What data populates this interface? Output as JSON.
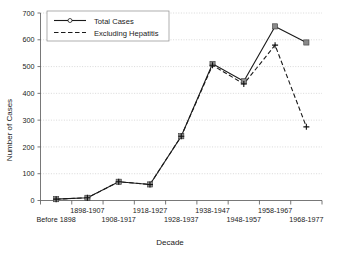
{
  "chart_data": {
    "type": "line",
    "title": "",
    "xlabel": "Decade",
    "ylabel": "Number of Cases",
    "categories": [
      "Before 1898",
      "1898-1907",
      "1908-1917",
      "1918-1927",
      "1928-1937",
      "1938-1947",
      "1948-1957",
      "1958-1967",
      "1968-1977"
    ],
    "series": [
      {
        "name": "Total Cases",
        "values": [
          5,
          10,
          70,
          60,
          240,
          510,
          445,
          650,
          590
        ],
        "style": "solid",
        "marker": "square"
      },
      {
        "name": "Excluding Hepatitis",
        "values": [
          5,
          10,
          70,
          60,
          240,
          505,
          435,
          580,
          275
        ],
        "style": "dashed",
        "marker": "plus"
      }
    ],
    "ylim": [
      0,
      700
    ],
    "yticks": [
      0,
      100,
      200,
      300,
      400,
      500,
      600,
      700
    ],
    "ytick_labels": [
      "0",
      "100",
      "200",
      "300",
      "400",
      "500",
      "600",
      "700"
    ],
    "grid": true,
    "grid_axis": "y",
    "legend_position": "top-left",
    "legend_entries": [
      "Total Cases",
      "Excluding Hepatitis"
    ],
    "xtick_rows": 2,
    "colors": {
      "line": "#1a1a1a",
      "marker_fill": "#8a8a8a",
      "grid": "#b9b9b9",
      "axis": "#555555",
      "background": "#ffffff"
    }
  }
}
